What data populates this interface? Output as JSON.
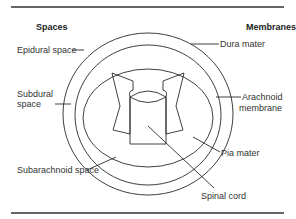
{
  "figure": {
    "headers": {
      "left": "Spaces",
      "right": "Membranes"
    },
    "labels": {
      "epidural_space": "Epidural space",
      "subdural_space_line1": "Subdural",
      "subdural_space_line2": "space",
      "subarachnoid_space": "Subarachnoid space",
      "dura_mater": "Dura mater",
      "arachnoid_membrane_line1": "Arachnoid",
      "arachnoid_membrane_line2": "membrane",
      "pia_mater": "Pia mater",
      "spinal_cord": "Spinal cord"
    }
  }
}
